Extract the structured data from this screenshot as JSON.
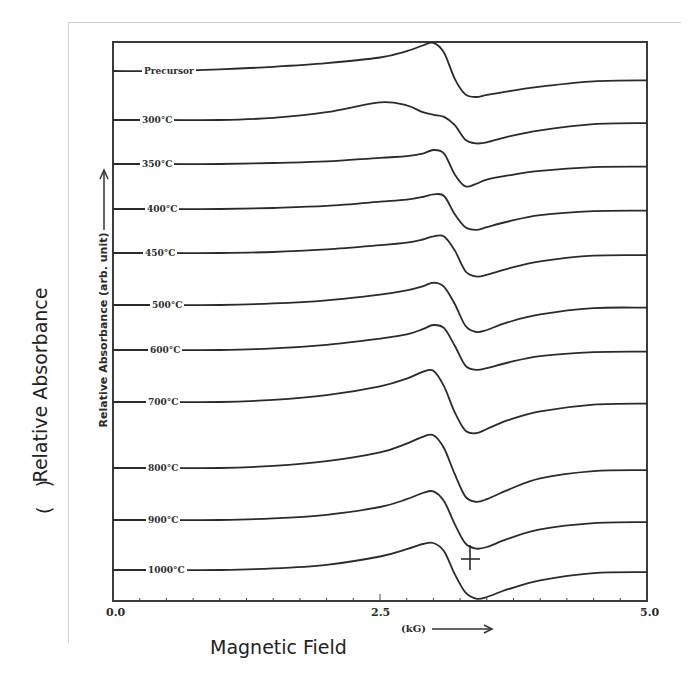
{
  "chart_data": {
    "type": "line",
    "title": "",
    "xlabel": "(kG)",
    "ylabel": "Relative Absorbance (arb. unit)",
    "outer_ylabel": "Relative Absorbance",
    "outer_yunit": "(   )",
    "outer_xlabel": "Magnetic Field",
    "xlim": [
      0.0,
      5.0
    ],
    "x_ticks": [
      "0.0",
      "2.5",
      "5.0"
    ],
    "grid": false,
    "legend": "inline labels at left of each trace",
    "note": "EPR/ESR derivative spectra stacked vertically with offsets; resonance near ~3.2-3.4 kG",
    "x": [
      0.0,
      0.5,
      1.0,
      1.5,
      2.0,
      2.5,
      2.75,
      2.9,
      3.0,
      3.1,
      3.2,
      3.3,
      3.4,
      3.5,
      3.7,
      4.0,
      4.5,
      5.0
    ],
    "series": [
      {
        "name": "Precursor",
        "offset_px": 71,
        "values": [
          0,
          0,
          0.3,
          0.8,
          1.5,
          2.6,
          3.8,
          4.9,
          5.4,
          3.5,
          -1.5,
          -4.5,
          -5.0,
          -4.6,
          -3.9,
          -3.0,
          -2.0,
          -1.8
        ]
      },
      {
        "name": "300°C",
        "offset_px": 120,
        "values": [
          0,
          0,
          0,
          0.4,
          1.5,
          3.4,
          2.8,
          1.5,
          1.0,
          0.6,
          -1.0,
          -3.8,
          -4.5,
          -4.3,
          -3.2,
          -2.0,
          -0.8,
          -0.6
        ]
      },
      {
        "name": "350°C",
        "offset_px": 164,
        "values": [
          0,
          0,
          0,
          0.2,
          0.5,
          1.2,
          1.5,
          2.0,
          2.7,
          2.0,
          -2.0,
          -4.3,
          -3.8,
          -3.0,
          -2.2,
          -1.3,
          -0.6,
          -0.5
        ]
      },
      {
        "name": "400°C",
        "offset_px": 209,
        "values": [
          0,
          0,
          0,
          0.2,
          0.6,
          1.4,
          1.8,
          2.3,
          2.8,
          2.5,
          -1.0,
          -3.5,
          -4.0,
          -3.5,
          -2.4,
          -1.2,
          -0.4,
          -0.3
        ]
      },
      {
        "name": "450°C",
        "offset_px": 253,
        "values": [
          0,
          0,
          0,
          0.2,
          0.7,
          1.5,
          2.0,
          2.6,
          3.2,
          3.2,
          0.5,
          -3.5,
          -4.5,
          -4.2,
          -3.0,
          -1.6,
          -0.5,
          -0.4
        ]
      },
      {
        "name": "500°C",
        "offset_px": 305,
        "values": [
          0,
          0,
          0,
          0.3,
          0.9,
          2.0,
          2.8,
          3.6,
          4.3,
          3.5,
          0.2,
          -4.0,
          -5.2,
          -4.8,
          -3.3,
          -1.8,
          -0.6,
          -0.5
        ]
      },
      {
        "name": "600°C",
        "offset_px": 350,
        "values": [
          0,
          0,
          0,
          0.3,
          1.0,
          2.2,
          3.0,
          4.0,
          4.8,
          4.2,
          0.8,
          -3.0,
          -3.8,
          -3.5,
          -2.4,
          -1.2,
          -0.4,
          -0.3
        ]
      },
      {
        "name": "700°C",
        "offset_px": 402,
        "values": [
          0,
          0,
          0,
          0.4,
          1.3,
          3.0,
          4.5,
          5.8,
          6.0,
          3.0,
          -2.0,
          -5.5,
          -6.0,
          -5.2,
          -3.5,
          -1.8,
          -0.5,
          -0.3
        ]
      },
      {
        "name": "800°C",
        "offset_px": 468,
        "values": [
          0,
          0,
          0,
          0.4,
          1.3,
          3.0,
          4.7,
          6.0,
          6.3,
          3.8,
          -1.2,
          -5.5,
          -6.5,
          -6.0,
          -4.2,
          -2.0,
          -0.6,
          -0.4
        ]
      },
      {
        "name": "900°C",
        "offset_px": 520,
        "values": [
          0,
          0,
          0,
          0.3,
          1.0,
          2.5,
          4.0,
          5.2,
          5.5,
          3.6,
          -0.8,
          -4.5,
          -5.5,
          -5.2,
          -3.6,
          -1.8,
          -0.6,
          -0.4
        ]
      },
      {
        "name": "1000°C",
        "offset_px": 570,
        "values": [
          0,
          0,
          0,
          0.3,
          1.0,
          2.6,
          4.0,
          5.0,
          5.2,
          3.6,
          -0.8,
          -4.3,
          -5.5,
          -5.2,
          -3.7,
          -2.0,
          -0.6,
          -0.4
        ]
      }
    ],
    "annotations": [
      "vertical marker (cross) on 1000°C trace near 3.3 kG"
    ]
  }
}
